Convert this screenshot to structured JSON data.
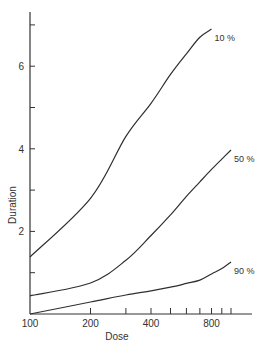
{
  "chart_data": {
    "type": "line",
    "title": "",
    "xlabel": "Dose",
    "ylabel": "Duration",
    "xscale": "log",
    "xlim": [
      100,
      1000
    ],
    "ylim": [
      0,
      7.5
    ],
    "x_ticks": [
      100,
      200,
      300,
      400,
      500,
      600,
      700,
      800,
      900,
      1000
    ],
    "x_tick_labels": [
      "100",
      "200",
      "",
      "400",
      "",
      "",
      "",
      "800",
      "",
      ""
    ],
    "y_ticks": [
      0,
      1,
      2,
      3,
      4,
      5,
      6,
      7
    ],
    "y_tick_labels": [
      "",
      "",
      "2",
      "",
      "4",
      "",
      "6",
      ""
    ],
    "grid": false,
    "legend": "inline curve labels at right end",
    "x": [
      100,
      200,
      300,
      400,
      500,
      600,
      700,
      800,
      900,
      1000
    ],
    "series": [
      {
        "name": "10%",
        "label": "10 %",
        "values": [
          1.38,
          2.8,
          4.3,
          5.1,
          5.8,
          6.3,
          6.7,
          6.9,
          null,
          null
        ]
      },
      {
        "name": "50%",
        "label": "50 %",
        "values": [
          0.44,
          0.75,
          1.3,
          1.9,
          2.4,
          2.85,
          3.2,
          3.5,
          3.75,
          3.97
        ]
      },
      {
        "name": "90%",
        "label": "90 %",
        "values": [
          0.0,
          0.29,
          0.46,
          0.56,
          0.65,
          0.74,
          0.82,
          0.97,
          1.1,
          1.26
        ]
      }
    ]
  }
}
